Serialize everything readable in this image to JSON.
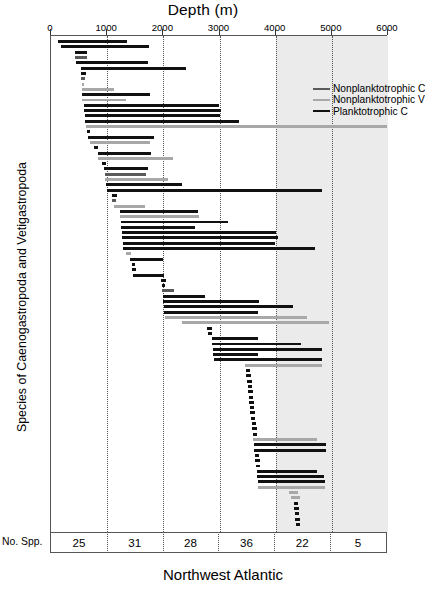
{
  "chart_title": "Depth (m)",
  "bottom_title": "Northwest Atlantic",
  "y_axis_title": "Species of Caenogastropoda and Vetigastropoda",
  "no_spp_label": "No. Spp.",
  "colors": {
    "planktotrophic_c": "#111111",
    "nonplanktotrophic_c": "#5a5a5a",
    "nonplanktotrophic_v": "#a8a8a8",
    "shaded_band": "#ebebeb",
    "frame": "#555555"
  },
  "legend": {
    "position": "top-right-inside",
    "items": [
      {
        "label": "Nonplanktotrophic C",
        "color": "#5a5a5a"
      },
      {
        "label": "Nonplanktotrophic V",
        "color": "#a8a8a8"
      },
      {
        "label": "Planktotrophic C",
        "color": "#111111"
      }
    ]
  },
  "chart_data": {
    "type": "bar",
    "orientation": "horizontal",
    "title": "Depth (m)",
    "xlabel": "Depth (m)",
    "ylabel": "Species of Caenogastropoda and Vetigastropoda",
    "subtitle": "Northwest Atlantic",
    "xlim": [
      0,
      6000
    ],
    "xticks": [
      0,
      1000,
      2000,
      3000,
      4000,
      5000,
      6000
    ],
    "grid": "vertical-dotted-at-xticks",
    "shaded_range": [
      4000,
      6000
    ],
    "series_names": [
      "Nonplanktotrophic C",
      "Nonplanktotrophic V",
      "Planktotrophic C"
    ],
    "no_spp_row": {
      "label": "No. Spp.",
      "bins": [
        "0-1000",
        "1000-2000",
        "2000-3000",
        "3000-4000",
        "4000-5000",
        "5000-6000"
      ],
      "values": [
        25,
        31,
        28,
        36,
        22,
        5
      ]
    },
    "bars": [
      {
        "min": 120,
        "max": 1350,
        "series": "Planktotrophic C"
      },
      {
        "min": 170,
        "max": 1750,
        "series": "Planktotrophic C"
      },
      {
        "min": 430,
        "max": 640,
        "series": "Planktotrophic C"
      },
      {
        "min": 430,
        "max": 640,
        "series": "Nonplanktotrophic C"
      },
      {
        "min": 440,
        "max": 1730,
        "series": "Planktotrophic C"
      },
      {
        "min": 540,
        "max": 2400,
        "series": "Planktotrophic C"
      },
      {
        "min": 530,
        "max": 620,
        "series": "Planktotrophic C"
      },
      {
        "min": 540,
        "max": 600,
        "series": "Nonplanktotrophic C"
      },
      {
        "min": 545,
        "max": 590,
        "series": "Nonplanktotrophic V"
      },
      {
        "min": 545,
        "max": 1120,
        "series": "Nonplanktotrophic V"
      },
      {
        "min": 545,
        "max": 1760,
        "series": "Planktotrophic C"
      },
      {
        "min": 560,
        "max": 1330,
        "series": "Nonplanktotrophic V"
      },
      {
        "min": 580,
        "max": 3000,
        "series": "Planktotrophic C"
      },
      {
        "min": 590,
        "max": 3030,
        "series": "Planktotrophic C"
      },
      {
        "min": 600,
        "max": 3010,
        "series": "Planktotrophic C"
      },
      {
        "min": 610,
        "max": 3350,
        "series": "Planktotrophic C"
      },
      {
        "min": 620,
        "max": 5990,
        "series": "Nonplanktotrophic V"
      },
      {
        "min": 640,
        "max": 700,
        "series": "Planktotrophic C"
      },
      {
        "min": 660,
        "max": 1840,
        "series": "Planktotrophic C"
      },
      {
        "min": 700,
        "max": 1760,
        "series": "Nonplanktotrophic V"
      },
      {
        "min": 760,
        "max": 830,
        "series": "Planktotrophic C"
      },
      {
        "min": 830,
        "max": 1780,
        "series": "Planktotrophic C"
      },
      {
        "min": 840,
        "max": 2180,
        "series": "Nonplanktotrophic V"
      },
      {
        "min": 900,
        "max": 980,
        "series": "Planktotrophic C"
      },
      {
        "min": 940,
        "max": 1720,
        "series": "Planktotrophic C"
      },
      {
        "min": 960,
        "max": 1700,
        "series": "Nonplanktotrophic C"
      },
      {
        "min": 970,
        "max": 2080,
        "series": "Nonplanktotrophic V"
      },
      {
        "min": 980,
        "max": 2340,
        "series": "Planktotrophic C"
      },
      {
        "min": 990,
        "max": 4830,
        "series": "Planktotrophic C"
      },
      {
        "min": 1080,
        "max": 1180,
        "series": "Planktotrophic C"
      },
      {
        "min": 1090,
        "max": 1160,
        "series": "Nonplanktotrophic C"
      },
      {
        "min": 1120,
        "max": 1680,
        "series": "Nonplanktotrophic V"
      },
      {
        "min": 1220,
        "max": 2620,
        "series": "Planktotrophic C"
      },
      {
        "min": 1230,
        "max": 2640,
        "series": "Nonplanktotrophic V"
      },
      {
        "min": 1240,
        "max": 3160,
        "series": "Planktotrophic C"
      },
      {
        "min": 1250,
        "max": 2560,
        "series": "Planktotrophic C"
      },
      {
        "min": 1260,
        "max": 4000,
        "series": "Planktotrophic C"
      },
      {
        "min": 1270,
        "max": 4050,
        "series": "Planktotrophic C"
      },
      {
        "min": 1280,
        "max": 3990,
        "series": "Planktotrophic C"
      },
      {
        "min": 1290,
        "max": 4700,
        "series": "Planktotrophic C"
      },
      {
        "min": 1340,
        "max": 1420,
        "series": "Nonplanktotrophic V"
      },
      {
        "min": 1400,
        "max": 2000,
        "series": "Planktotrophic C"
      },
      {
        "min": 1440,
        "max": 1500,
        "series": "Planktotrophic C"
      },
      {
        "min": 1450,
        "max": 1510,
        "series": "Planktotrophic C"
      },
      {
        "min": 1460,
        "max": 2010,
        "series": "Planktotrophic C"
      },
      {
        "min": 1960,
        "max": 2040,
        "series": "Planktotrophic C"
      },
      {
        "min": 1970,
        "max": 2030,
        "series": "Planktotrophic C"
      },
      {
        "min": 1980,
        "max": 2190,
        "series": "Nonplanktotrophic C"
      },
      {
        "min": 1990,
        "max": 2740,
        "series": "Planktotrophic C"
      },
      {
        "min": 2000,
        "max": 3700,
        "series": "Planktotrophic C"
      },
      {
        "min": 2010,
        "max": 4300,
        "series": "Planktotrophic C"
      },
      {
        "min": 2020,
        "max": 3680,
        "series": "Planktotrophic C"
      },
      {
        "min": 2030,
        "max": 4560,
        "series": "Nonplanktotrophic V"
      },
      {
        "min": 2330,
        "max": 4950,
        "series": "Nonplanktotrophic V"
      },
      {
        "min": 2780,
        "max": 2860,
        "series": "Planktotrophic C"
      },
      {
        "min": 2790,
        "max": 2870,
        "series": "Planktotrophic C"
      },
      {
        "min": 2860,
        "max": 3690,
        "series": "Planktotrophic C"
      },
      {
        "min": 2870,
        "max": 4460,
        "series": "Planktotrophic C"
      },
      {
        "min": 2880,
        "max": 4820,
        "series": "Planktotrophic C"
      },
      {
        "min": 2890,
        "max": 3680,
        "series": "Planktotrophic C"
      },
      {
        "min": 2900,
        "max": 4830,
        "series": "Planktotrophic C"
      },
      {
        "min": 3460,
        "max": 4820,
        "series": "Nonplanktotrophic V"
      },
      {
        "min": 3470,
        "max": 3550,
        "series": "Planktotrophic C"
      },
      {
        "min": 3480,
        "max": 3560,
        "series": "Planktotrophic C"
      },
      {
        "min": 3490,
        "max": 3570,
        "series": "Planktotrophic C"
      },
      {
        "min": 3500,
        "max": 3580,
        "series": "Planktotrophic C"
      },
      {
        "min": 3510,
        "max": 3590,
        "series": "Planktotrophic C"
      },
      {
        "min": 3520,
        "max": 3600,
        "series": "Planktotrophic C"
      },
      {
        "min": 3530,
        "max": 3610,
        "series": "Planktotrophic C"
      },
      {
        "min": 3540,
        "max": 3620,
        "series": "Planktotrophic C"
      },
      {
        "min": 3550,
        "max": 3630,
        "series": "Planktotrophic C"
      },
      {
        "min": 3560,
        "max": 3640,
        "series": "Planktotrophic C"
      },
      {
        "min": 3570,
        "max": 3650,
        "series": "Planktotrophic C"
      },
      {
        "min": 3580,
        "max": 3660,
        "series": "Planktotrophic C"
      },
      {
        "min": 3590,
        "max": 3670,
        "series": "Planktotrophic C"
      },
      {
        "min": 3600,
        "max": 4740,
        "series": "Nonplanktotrophic V"
      },
      {
        "min": 3610,
        "max": 4900,
        "series": "Planktotrophic C"
      },
      {
        "min": 3620,
        "max": 4890,
        "series": "Planktotrophic C"
      },
      {
        "min": 3630,
        "max": 3710,
        "series": "Planktotrophic C"
      },
      {
        "min": 3640,
        "max": 3720,
        "series": "Planktotrophic C"
      },
      {
        "min": 3650,
        "max": 3730,
        "series": "Planktotrophic C"
      },
      {
        "min": 3660,
        "max": 4740,
        "series": "Planktotrophic C"
      },
      {
        "min": 3670,
        "max": 4860,
        "series": "Planktotrophic C"
      },
      {
        "min": 3680,
        "max": 4880,
        "series": "Planktotrophic C"
      },
      {
        "min": 3690,
        "max": 4870,
        "series": "Nonplanktotrophic V"
      },
      {
        "min": 4240,
        "max": 4400,
        "series": "Nonplanktotrophic V"
      },
      {
        "min": 4280,
        "max": 4430,
        "series": "Nonplanktotrophic V"
      },
      {
        "min": 4320,
        "max": 4400,
        "series": "Planktotrophic C"
      },
      {
        "min": 4330,
        "max": 4410,
        "series": "Planktotrophic C"
      },
      {
        "min": 4340,
        "max": 4420,
        "series": "Planktotrophic C"
      },
      {
        "min": 4350,
        "max": 4430,
        "series": "Planktotrophic C"
      },
      {
        "min": 4360,
        "max": 4440,
        "series": "Planktotrophic C"
      }
    ]
  }
}
